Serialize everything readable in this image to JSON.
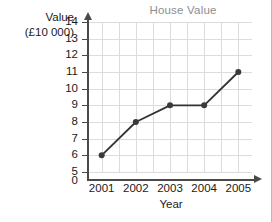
{
  "chart_data": {
    "type": "line",
    "title": "House Value",
    "xlabel": "Year",
    "ylabel": "Value (£10 000)",
    "ylabel_line1": "Value",
    "ylabel_line2": "(£10 000)",
    "categories": [
      "2001",
      "2002",
      "2003",
      "2004",
      "2005"
    ],
    "x": [
      2001,
      2002,
      2003,
      2004,
      2005
    ],
    "values": [
      6,
      8,
      9,
      9,
      11
    ],
    "series": [
      {
        "name": "House Value",
        "values": [
          6,
          8,
          9,
          9,
          11
        ]
      }
    ],
    "ylim": [
      5,
      14
    ],
    "yticks": [
      14,
      13,
      12,
      11,
      10,
      9,
      8,
      7,
      6,
      5
    ],
    "ytick_labels": [
      "14",
      "13",
      "12",
      "11",
      "10",
      "9",
      "8",
      "7",
      "6",
      "5"
    ],
    "origin_label": "0",
    "axis_break": true,
    "xlim": [
      2000.6,
      2005.4
    ],
    "grid": true,
    "grid_minor_x": true,
    "legend": "none",
    "line_color": "#333333",
    "marker_color": "#3a3a3a",
    "grid_color": "#dcdcdc",
    "axis_color": "#4a4a4a",
    "title_color": "#8d8d8d",
    "text_color": "#1a1a1a",
    "background": "#ffffff"
  }
}
